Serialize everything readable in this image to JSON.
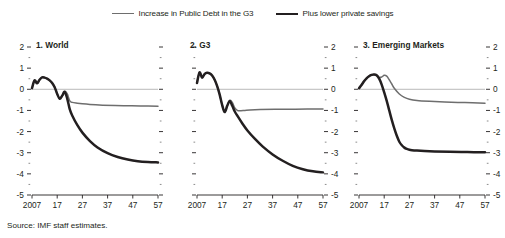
{
  "legend": {
    "entries": [
      {
        "label": "Increase in Public Debt in the G3",
        "icon": "line-swatch-thin",
        "color": "#6e6e6e"
      },
      {
        "label": "Plus lower private savings",
        "icon": "line-swatch-thick",
        "color": "#231f20"
      }
    ]
  },
  "source": {
    "text": "Source: IMF staff estimates."
  },
  "axis": {
    "y_ticks": [
      "2",
      "1",
      "0",
      "-1",
      "-2",
      "-3",
      "-4",
      "-5"
    ],
    "x_ticks": [
      "2007",
      "17",
      "27",
      "37",
      "47",
      "57"
    ]
  },
  "chart_data": [
    {
      "type": "line",
      "title": "1. World",
      "panel": 1,
      "xlabel": "",
      "ylabel": "",
      "xlim": [
        2007,
        2057
      ],
      "ylim": [
        -5,
        2
      ],
      "xticklabels": [
        "2007",
        "17",
        "27",
        "37",
        "47",
        "57"
      ],
      "xtickvalues": [
        2007,
        2017,
        2027,
        2037,
        2047,
        2057
      ],
      "yticklabels": [
        "2",
        "1",
        "0",
        "-1",
        "-2",
        "-3",
        "-4",
        "-5"
      ],
      "ytickvalues": [
        2,
        1,
        0,
        -1,
        -2,
        -3,
        -4,
        -5
      ],
      "y_axis_labels_side": "left",
      "grid": false,
      "zero_line": true,
      "legend_position": "top-center (shared)",
      "series": [
        {
          "name": "Increase in Public Debt in the G3",
          "color": "#6e6e6e",
          "x": [
            2007,
            2008,
            2009,
            2010,
            2011,
            2012,
            2013,
            2014,
            2015,
            2016,
            2017,
            2018,
            2019,
            2020,
            2021,
            2022,
            2023,
            2025,
            2027,
            2030,
            2035,
            2040,
            2045,
            2050,
            2057
          ],
          "values": [
            0.05,
            0.42,
            0.28,
            0.45,
            0.56,
            0.55,
            0.5,
            0.42,
            0.3,
            0.1,
            -0.22,
            -0.45,
            -0.3,
            -0.1,
            -0.22,
            -0.55,
            -0.62,
            -0.66,
            -0.69,
            -0.72,
            -0.75,
            -0.77,
            -0.78,
            -0.79,
            -0.8
          ]
        },
        {
          "name": "Plus lower private savings",
          "color": "#231f20",
          "x": [
            2007,
            2008,
            2009,
            2010,
            2011,
            2012,
            2013,
            2014,
            2015,
            2016,
            2017,
            2018,
            2019,
            2020,
            2021,
            2022,
            2023,
            2025,
            2027,
            2030,
            2033,
            2037,
            2041,
            2045,
            2049,
            2053,
            2057
          ],
          "values": [
            0.05,
            0.42,
            0.28,
            0.45,
            0.56,
            0.55,
            0.5,
            0.42,
            0.3,
            0.1,
            -0.22,
            -0.45,
            -0.3,
            -0.12,
            -0.45,
            -0.95,
            -1.25,
            -1.7,
            -2.05,
            -2.45,
            -2.75,
            -3.02,
            -3.2,
            -3.32,
            -3.4,
            -3.44,
            -3.46
          ]
        }
      ]
    },
    {
      "type": "line",
      "title": "2. G3",
      "panel": 2,
      "xlabel": "",
      "ylabel": "",
      "xlim": [
        2007,
        2057
      ],
      "ylim": [
        -5,
        2
      ],
      "xticklabels": [
        "2007",
        "17",
        "27",
        "37",
        "47",
        "57"
      ],
      "xtickvalues": [
        2007,
        2017,
        2027,
        2037,
        2047,
        2057
      ],
      "yticklabels": [
        "2",
        "1",
        "0",
        "-1",
        "-2",
        "-3",
        "-4",
        "-5"
      ],
      "ytickvalues": [
        2,
        1,
        0,
        -1,
        -2,
        -3,
        -4,
        -5
      ],
      "y_axis_labels_side": "right",
      "grid": false,
      "zero_line": true,
      "legend_position": "top-center (shared)",
      "series": [
        {
          "name": "Increase in Public Debt in the G3",
          "color": "#6e6e6e",
          "x": [
            2007,
            2008,
            2009,
            2010,
            2011,
            2012,
            2013,
            2014,
            2015,
            2016,
            2017,
            2018,
            2019,
            2020,
            2021,
            2022,
            2023,
            2024,
            2026,
            2028,
            2032,
            2038,
            2046,
            2057
          ],
          "values": [
            0.3,
            0.8,
            0.55,
            0.72,
            0.78,
            0.75,
            0.65,
            0.45,
            0.15,
            -0.25,
            -0.75,
            -1.08,
            -0.78,
            -0.52,
            -0.62,
            -0.88,
            -1.0,
            -1.02,
            -1.0,
            -0.98,
            -0.96,
            -0.95,
            -0.94,
            -0.93
          ]
        },
        {
          "name": "Plus lower private savings",
          "color": "#231f20",
          "x": [
            2007,
            2008,
            2009,
            2010,
            2011,
            2012,
            2013,
            2014,
            2015,
            2016,
            2017,
            2018,
            2019,
            2020,
            2021,
            2022,
            2023,
            2025,
            2027,
            2030,
            2033,
            2037,
            2041,
            2045,
            2049,
            2053,
            2057
          ],
          "values": [
            0.3,
            0.8,
            0.55,
            0.72,
            0.78,
            0.75,
            0.65,
            0.45,
            0.15,
            -0.25,
            -0.75,
            -1.08,
            -0.78,
            -0.55,
            -0.78,
            -1.05,
            -1.25,
            -1.62,
            -1.95,
            -2.35,
            -2.7,
            -3.08,
            -3.38,
            -3.62,
            -3.78,
            -3.88,
            -3.93
          ]
        }
      ]
    },
    {
      "type": "line",
      "title": "3. Emerging Markets",
      "panel": 3,
      "xlabel": "",
      "ylabel": "",
      "xlim": [
        2007,
        2057
      ],
      "ylim": [
        -5,
        2
      ],
      "xticklabels": [
        "2007",
        "17",
        "27",
        "37",
        "47",
        "57"
      ],
      "xtickvalues": [
        2007,
        2017,
        2027,
        2037,
        2047,
        2057
      ],
      "yticklabels": [
        "2",
        "1",
        "0",
        "-1",
        "-2",
        "-3",
        "-4",
        "-5"
      ],
      "ytickvalues": [
        2,
        1,
        0,
        -1,
        -2,
        -3,
        -4,
        -5
      ],
      "y_axis_labels_side": "right",
      "grid": false,
      "zero_line": true,
      "legend_position": "top-center (shared)",
      "series": [
        {
          "name": "Increase in Public Debt in the G3",
          "color": "#6e6e6e",
          "x": [
            2007,
            2008,
            2009,
            2010,
            2011,
            2012,
            2013,
            2014,
            2015,
            2016,
            2017,
            2018,
            2019,
            2020,
            2021,
            2023,
            2025,
            2027,
            2030,
            2035,
            2041,
            2049,
            2057
          ],
          "values": [
            0.05,
            0.2,
            0.38,
            0.52,
            0.62,
            0.68,
            0.7,
            0.66,
            0.56,
            0.58,
            0.66,
            0.62,
            0.45,
            0.25,
            0.05,
            -0.22,
            -0.38,
            -0.47,
            -0.53,
            -0.57,
            -0.6,
            -0.63,
            -0.66
          ]
        },
        {
          "name": "Plus lower private savings",
          "color": "#231f20",
          "x": [
            2007,
            2008,
            2009,
            2010,
            2011,
            2012,
            2013,
            2014,
            2015,
            2016,
            2017,
            2018,
            2019,
            2020,
            2021,
            2022,
            2023,
            2024,
            2025,
            2026,
            2027,
            2028,
            2030,
            2033,
            2037,
            2043,
            2050,
            2057
          ],
          "values": [
            0.05,
            0.2,
            0.38,
            0.52,
            0.62,
            0.68,
            0.7,
            0.66,
            0.5,
            0.22,
            -0.15,
            -0.55,
            -1.0,
            -1.45,
            -1.85,
            -2.2,
            -2.48,
            -2.65,
            -2.76,
            -2.82,
            -2.86,
            -2.88,
            -2.9,
            -2.92,
            -2.94,
            -2.96,
            -2.97,
            -2.98
          ]
        }
      ]
    }
  ]
}
